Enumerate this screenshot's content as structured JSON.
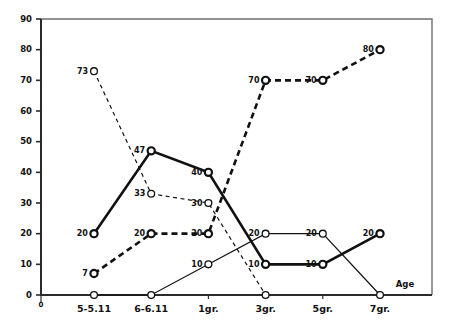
{
  "chart_data": {
    "type": "line",
    "title": "",
    "subtitle": "",
    "xlabel": "Age",
    "ylabel": "",
    "ylim": [
      0,
      90
    ],
    "ytick_step": 10,
    "yticks": [
      0,
      10,
      20,
      30,
      40,
      50,
      60,
      70,
      80,
      90
    ],
    "origin_label": "0",
    "grid": false,
    "legend": false,
    "legend_position": "none",
    "categories": [
      "5-5.11",
      "6-6.11",
      "1gr.",
      "3gr.",
      "5gr.",
      "7gr."
    ],
    "marker": "open-circle",
    "series": [
      {
        "name": "thick-solid",
        "style": "solid",
        "weight": "thick",
        "values": [
          20,
          47,
          40,
          10,
          10,
          20
        ],
        "labels": [
          "20",
          "47",
          "40",
          "10",
          "10",
          "20"
        ]
      },
      {
        "name": "thick-dashed",
        "style": "dashed",
        "weight": "thick",
        "values": [
          7,
          20,
          20,
          70,
          70,
          80
        ],
        "labels": [
          "7",
          "20",
          "20",
          "70",
          "70",
          "80"
        ]
      },
      {
        "name": "thin-dashed",
        "style": "dashed",
        "weight": "thin",
        "values": [
          73,
          33,
          30,
          0,
          null,
          null
        ],
        "labels": [
          "73",
          "33",
          "30",
          "",
          "",
          ""
        ]
      },
      {
        "name": "thin-solid",
        "style": "solid",
        "weight": "thin",
        "values": [
          0,
          0,
          10,
          20,
          20,
          0
        ],
        "labels": [
          "",
          "",
          "10",
          "20",
          "20",
          ""
        ]
      }
    ]
  },
  "colors": {
    "ink": "#111111",
    "axis": "#2b2b2b",
    "frame": "#6e6e6e",
    "background": "#ffffff"
  }
}
